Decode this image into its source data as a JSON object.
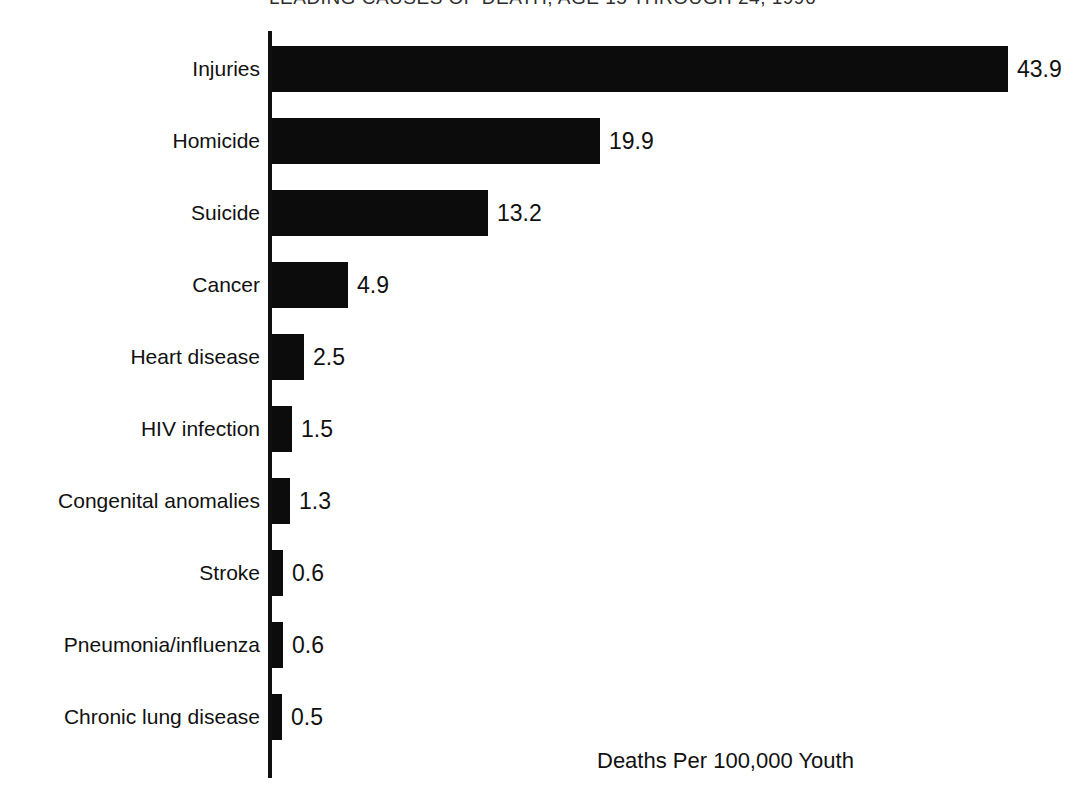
{
  "chart_data": {
    "type": "bar",
    "orientation": "horizontal",
    "title": "LEADING CAUSES OF DEATH, AGE 15 THROUGH 24, 1996",
    "title_note": "title is cropped at the top edge of the image; only the lower fragment \"...AGE 15 THROUGH 24, 19...\" is legible",
    "xlabel": "Deaths Per 100,000 Youth",
    "ylabel": "",
    "xlim": [
      0,
      43.9
    ],
    "grid": false,
    "legend": null,
    "bar_color": "#0c0c0c",
    "categories": [
      "Injuries",
      "Homicide",
      "Suicide",
      "Cancer",
      "Heart disease",
      "HIV infection",
      "Congenital anomalies",
      "Stroke",
      "Pneumonia/influenza",
      "Chronic lung disease"
    ],
    "values": [
      43.9,
      19.9,
      13.2,
      4.9,
      2.5,
      1.5,
      1.3,
      0.6,
      0.6,
      0.5
    ],
    "value_labels": [
      "43.9",
      "19.9",
      "13.2",
      "4.9",
      "2.5",
      "1.5",
      "1.3",
      "0.6",
      "0.6",
      "0.5"
    ]
  },
  "rows": [
    {
      "label": "Injuries",
      "value_label": "43.9",
      "bar_px": 736,
      "top_px": 46
    },
    {
      "label": "Homicide",
      "value_label": "19.9",
      "bar_px": 328,
      "top_px": 118
    },
    {
      "label": "Suicide",
      "value_label": "13.2",
      "bar_px": 216,
      "top_px": 190
    },
    {
      "label": "Cancer",
      "value_label": "4.9",
      "bar_px": 76,
      "top_px": 262
    },
    {
      "label": "Heart disease",
      "value_label": "2.5",
      "bar_px": 32,
      "top_px": 334
    },
    {
      "label": "HIV infection",
      "value_label": "1.5",
      "bar_px": 20,
      "top_px": 406
    },
    {
      "label": "Congenital anomalies",
      "value_label": "1.3",
      "bar_px": 18,
      "top_px": 478
    },
    {
      "label": "Stroke",
      "value_label": "0.6",
      "bar_px": 11,
      "top_px": 550
    },
    {
      "label": "Pneumonia/influenza",
      "value_label": "0.6",
      "bar_px": 11,
      "top_px": 622
    },
    {
      "label": "Chronic lung disease",
      "value_label": "0.5",
      "bar_px": 10,
      "top_px": 694
    }
  ],
  "axis_caption": "Deaths Per 100,000 Youth"
}
